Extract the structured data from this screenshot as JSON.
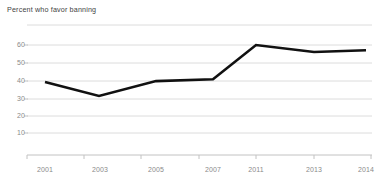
{
  "chart_data": {
    "type": "line",
    "title": "Percent who favor banning",
    "subtitle": "",
    "xlabel": "",
    "ylabel": "",
    "categories": [
      "2001",
      "2003",
      "2005",
      "2007",
      "2011",
      "2013",
      "2014"
    ],
    "x": [
      2001,
      2003,
      2005,
      2007,
      2011,
      2013,
      2014
    ],
    "values": [
      39,
      31,
      39.5,
      40.5,
      60,
      56,
      57
    ],
    "series": [
      {
        "name": "Percent who favor banning",
        "values": [
          39,
          31,
          39.5,
          40.5,
          60,
          56,
          57
        ],
        "color": "#000000"
      }
    ],
    "ylim": [
      0,
      70
    ],
    "yticks": [
      10,
      20,
      30,
      40,
      50,
      60
    ],
    "ytick_labels": [
      "10",
      "20",
      "30",
      "40",
      "50",
      "60"
    ],
    "gridlines": [
      0,
      10,
      20,
      30,
      40,
      50,
      60,
      70
    ],
    "grid": true,
    "grid_color": "#d9d9d9",
    "legend": false,
    "legend_position": "none",
    "line_color": "#000000",
    "line_width": 2.6,
    "markers": false,
    "axis_color": "#bdbdbd",
    "background": "#ffffff",
    "text_color": "#8a8a8a",
    "title_color": "#3f3f3f"
  },
  "axis": {
    "y_labels": [
      "60",
      "50",
      "40",
      "30",
      "20",
      "10"
    ],
    "x_labels": [
      "2001",
      "2003",
      "2005",
      "2007",
      "2011",
      "2013",
      "2014"
    ]
  }
}
